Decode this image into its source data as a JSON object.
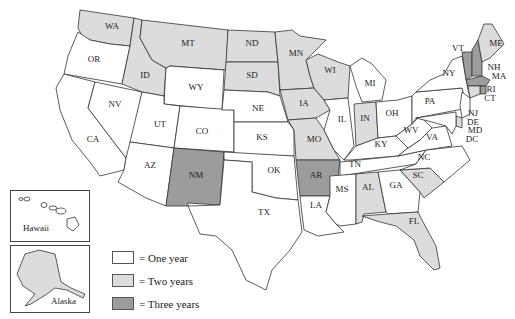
{
  "colors": {
    "one_year": "#ffffff",
    "two_years": "#dcdcdc",
    "three_years": "#9c9c9c",
    "border": "#333333"
  },
  "legend": {
    "items": [
      {
        "key": "one_year",
        "label": "= One year"
      },
      {
        "key": "two_years",
        "label": "= Two years"
      },
      {
        "key": "three_years",
        "label": "= Three years"
      }
    ]
  },
  "insets": {
    "hawaii": {
      "label": "Hawaii",
      "category": "one_year"
    },
    "alaska": {
      "label": "Alaska",
      "category": "two_years"
    }
  },
  "states": {
    "WA": {
      "label": "WA",
      "category": "two_years"
    },
    "OR": {
      "label": "OR",
      "category": "one_year"
    },
    "CA": {
      "label": "CA",
      "category": "one_year"
    },
    "NV": {
      "label": "NV",
      "category": "one_year"
    },
    "ID": {
      "label": "ID",
      "category": "two_years"
    },
    "MT": {
      "label": "MT",
      "category": "two_years"
    },
    "WY": {
      "label": "WY",
      "category": "one_year"
    },
    "UT": {
      "label": "UT",
      "category": "one_year"
    },
    "CO": {
      "label": "CO",
      "category": "one_year"
    },
    "AZ": {
      "label": "AZ",
      "category": "one_year"
    },
    "NM": {
      "label": "NM",
      "category": "three_years"
    },
    "ND": {
      "label": "ND",
      "category": "two_years"
    },
    "SD": {
      "label": "SD",
      "category": "two_years"
    },
    "NE": {
      "label": "NE",
      "category": "one_year"
    },
    "KS": {
      "label": "KS",
      "category": "one_year"
    },
    "OK": {
      "label": "OK",
      "category": "one_year"
    },
    "TX": {
      "label": "TX",
      "category": "one_year"
    },
    "MN": {
      "label": "MN",
      "category": "two_years"
    },
    "IA": {
      "label": "IA",
      "category": "two_years"
    },
    "MO": {
      "label": "MO",
      "category": "two_years"
    },
    "AR": {
      "label": "AR",
      "category": "three_years"
    },
    "LA": {
      "label": "LA",
      "category": "one_year"
    },
    "WI": {
      "label": "WI",
      "category": "two_years"
    },
    "IL": {
      "label": "IL",
      "category": "one_year"
    },
    "MI": {
      "label": "MI",
      "category": "one_year"
    },
    "IN": {
      "label": "IN",
      "category": "two_years"
    },
    "OH": {
      "label": "OH",
      "category": "one_year"
    },
    "KY": {
      "label": "KY",
      "category": "one_year"
    },
    "TN": {
      "label": "TN",
      "category": "one_year"
    },
    "MS": {
      "label": "MS",
      "category": "one_year"
    },
    "AL": {
      "label": "AL",
      "category": "two_years"
    },
    "GA": {
      "label": "GA",
      "category": "one_year"
    },
    "FL": {
      "label": "FL",
      "category": "two_years"
    },
    "SC": {
      "label": "SC",
      "category": "two_years"
    },
    "NC": {
      "label": "NC",
      "category": "one_year"
    },
    "VA": {
      "label": "VA",
      "category": "one_year"
    },
    "WV": {
      "label": "WV",
      "category": "one_year"
    },
    "PA": {
      "label": "PA",
      "category": "one_year"
    },
    "NY": {
      "label": "NY",
      "category": "one_year"
    },
    "NJ": {
      "label": "NJ",
      "category": "one_year"
    },
    "DE": {
      "label": "DE",
      "category": "two_years"
    },
    "MD": {
      "label": "MD",
      "category": "one_year"
    },
    "DC": {
      "label": "DC",
      "category": "one_year"
    },
    "VT": {
      "label": "VT",
      "category": "three_years"
    },
    "NH": {
      "label": "NH",
      "category": "three_years"
    },
    "MA": {
      "label": "MA",
      "category": "three_years"
    },
    "RI": {
      "label": "RI",
      "category": "three_years"
    },
    "CT": {
      "label": "CT",
      "category": "two_years"
    },
    "ME": {
      "label": "ME",
      "category": "two_years"
    }
  }
}
